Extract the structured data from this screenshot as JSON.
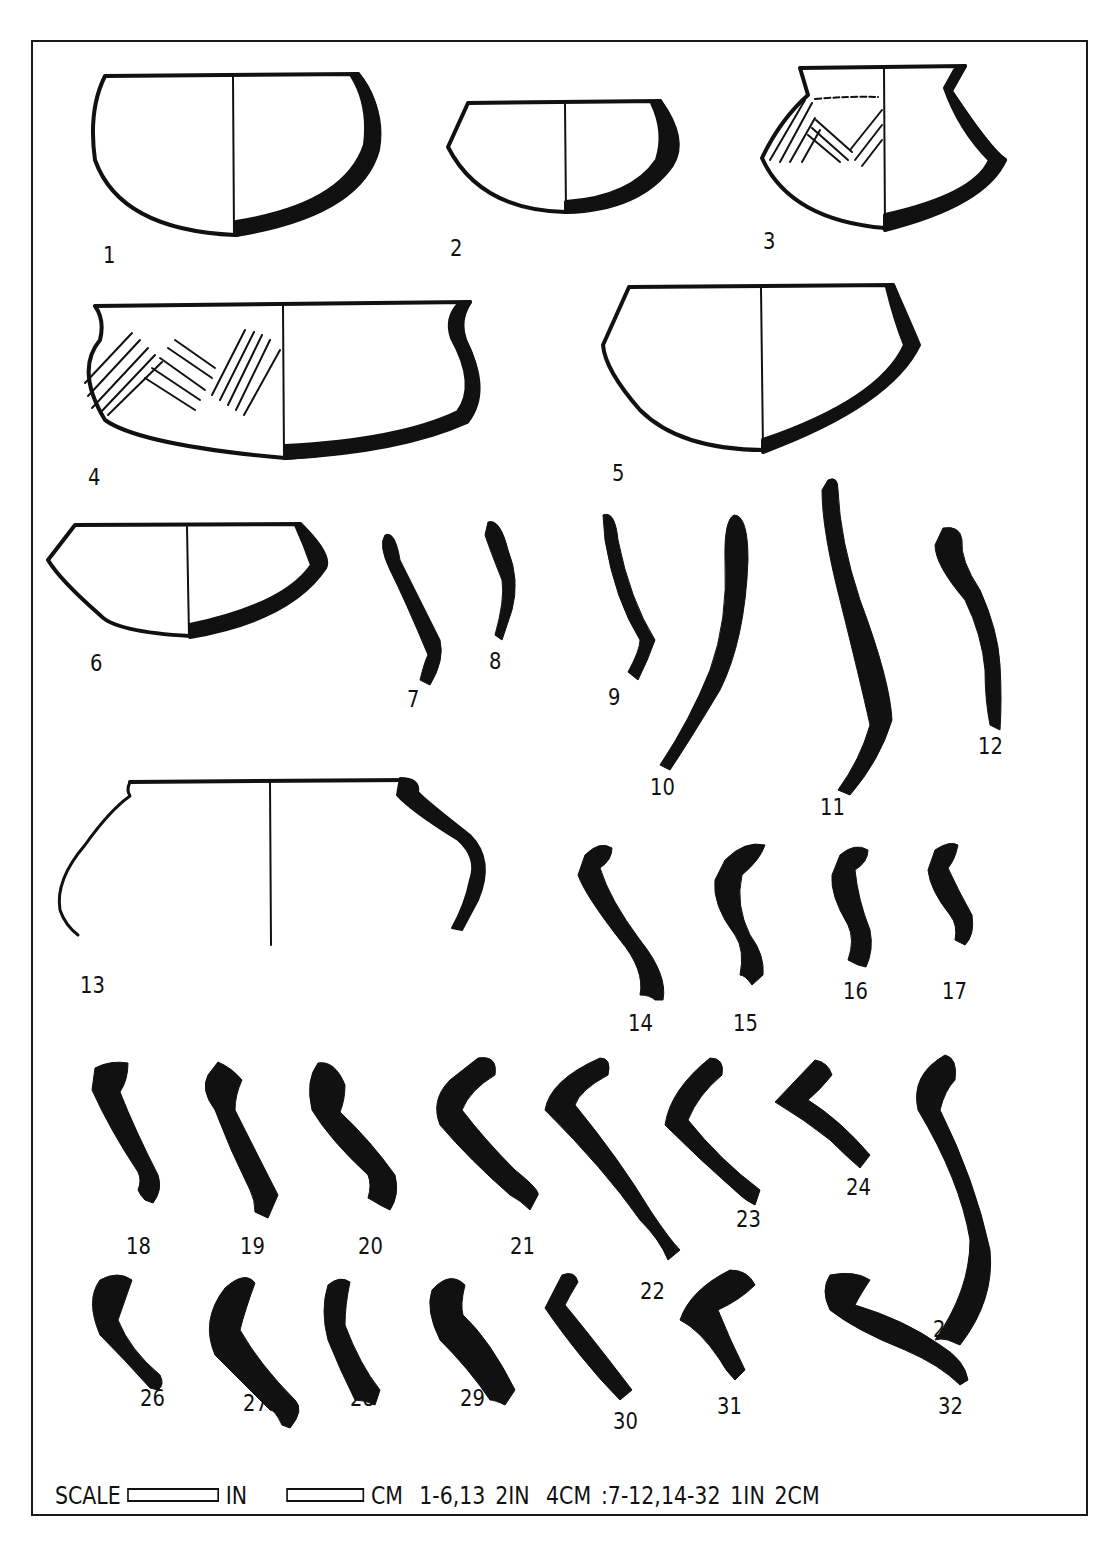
{
  "figure": {
    "type": "archaeological pottery plate",
    "ink_color": "#111111",
    "paper_color": "#ffffff",
    "vessels": [
      {
        "id": 1,
        "label": "1",
        "form": "hemispherical bowl, section profile right",
        "decorated": false
      },
      {
        "id": 2,
        "label": "2",
        "form": "small carinated bowl",
        "decorated": false
      },
      {
        "id": 3,
        "label": "3",
        "form": "flared-neck carinated pot with incised chevron/hatched decoration",
        "decorated": true
      },
      {
        "id": 4,
        "label": "4",
        "form": "wide bowl with everted rim and incised hatched chevron band",
        "decorated": true
      },
      {
        "id": 5,
        "label": "5",
        "form": "carinated bowl",
        "decorated": false
      },
      {
        "id": 6,
        "label": "6",
        "form": "shallow carinated bowl",
        "decorated": false
      },
      {
        "id": 13,
        "label": "13",
        "form": "large open-mouthed jar with rolled rim",
        "decorated": false
      }
    ],
    "rim_sherds": [
      "7",
      "8",
      "9",
      "10",
      "11",
      "12",
      "14",
      "15",
      "16",
      "17",
      "18",
      "19",
      "20",
      "21",
      "22",
      "23",
      "24",
      "25",
      "26",
      "27",
      "28",
      "29",
      "30",
      "31",
      "32"
    ]
  },
  "labels": {
    "n1": "1",
    "n2": "2",
    "n3": "3",
    "n4": "4",
    "n5": "5",
    "n6": "6",
    "n7": "7",
    "n8": "8",
    "n9": "9",
    "n10": "10",
    "n11": "11",
    "n12": "12",
    "n13": "13",
    "n14": "14",
    "n15": "15",
    "n16": "16",
    "n17": "17",
    "n18": "18",
    "n19": "19",
    "n20": "20",
    "n21": "21",
    "n22": "22",
    "n23": "23",
    "n24": "24",
    "n25": "25",
    "n26": "26",
    "n27": "27",
    "n28": "28",
    "n29": "29",
    "n30": "30",
    "n31": "31",
    "n32": "32"
  },
  "scale": {
    "prefix": "SCALE",
    "unit_in": "IN",
    "unit_cm": "CM",
    "group1": "1-6,13",
    "group1_in": "2IN",
    "group1_cm": "4CM",
    "group2": ":7-12,14-32",
    "group2_in": "1IN",
    "group2_cm": "2CM"
  }
}
